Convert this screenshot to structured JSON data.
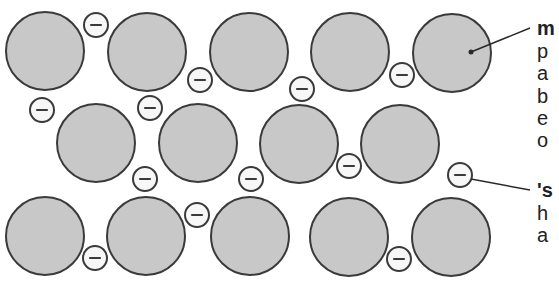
{
  "colors": {
    "ion_fill": "#c8c8c8",
    "ion_stroke": "#3a3a3a",
    "electron_fill": "#f7f7f7",
    "electron_stroke": "#3a3a3a",
    "line": "#2a2a2a",
    "text": "#222222"
  },
  "ions": [
    {
      "cx": 45,
      "cy": 51,
      "r": 39
    },
    {
      "cx": 147,
      "cy": 52,
      "r": 39
    },
    {
      "cx": 249,
      "cy": 52,
      "r": 39
    },
    {
      "cx": 350,
      "cy": 52,
      "r": 39
    },
    {
      "cx": 452,
      "cy": 53,
      "r": 39
    },
    {
      "cx": 96,
      "cy": 143,
      "r": 39
    },
    {
      "cx": 198,
      "cy": 143,
      "r": 39
    },
    {
      "cx": 299,
      "cy": 144,
      "r": 39
    },
    {
      "cx": 400,
      "cy": 144,
      "r": 39
    },
    {
      "cx": 45,
      "cy": 236,
      "r": 39
    },
    {
      "cx": 146,
      "cy": 236,
      "r": 39
    },
    {
      "cx": 250,
      "cy": 236,
      "r": 39
    },
    {
      "cx": 349,
      "cy": 237,
      "r": 39
    },
    {
      "cx": 451,
      "cy": 237,
      "r": 39
    }
  ],
  "electrons": [
    {
      "cx": 96,
      "cy": 25,
      "r": 12,
      "symbol": "−"
    },
    {
      "cx": 200,
      "cy": 80,
      "r": 12,
      "symbol": "−"
    },
    {
      "cx": 302,
      "cy": 89,
      "r": 12,
      "symbol": "−"
    },
    {
      "cx": 402,
      "cy": 75,
      "r": 12,
      "symbol": "−"
    },
    {
      "cx": 42,
      "cy": 110,
      "r": 12,
      "symbol": "−"
    },
    {
      "cx": 150,
      "cy": 108,
      "r": 12,
      "symbol": "−"
    },
    {
      "cx": 145,
      "cy": 179,
      "r": 12,
      "symbol": "−"
    },
    {
      "cx": 251,
      "cy": 179,
      "r": 12,
      "symbol": "−"
    },
    {
      "cx": 349,
      "cy": 166,
      "r": 12,
      "symbol": "−"
    },
    {
      "cx": 460,
      "cy": 175,
      "r": 12,
      "symbol": "−"
    },
    {
      "cx": 95,
      "cy": 258,
      "r": 12,
      "symbol": "−"
    },
    {
      "cx": 197,
      "cy": 215,
      "r": 12,
      "symbol": "−"
    },
    {
      "cx": 399,
      "cy": 259,
      "r": 12,
      "symbol": "−"
    }
  ],
  "pointers": [
    {
      "x1": 471,
      "y1": 52,
      "x2": 530,
      "y2": 28,
      "dot": true
    },
    {
      "x1": 471,
      "y1": 179,
      "x2": 530,
      "y2": 190,
      "dot": false
    }
  ],
  "labels": {
    "ion_label": {
      "lines": [
        {
          "text": "m",
          "bold": true,
          "top": 18
        },
        {
          "text": "p",
          "bold": false,
          "top": 41
        },
        {
          "text": "a",
          "bold": false,
          "top": 63
        },
        {
          "text": "b",
          "bold": false,
          "top": 86
        },
        {
          "text": "e",
          "bold": false,
          "top": 108
        },
        {
          "text": "o",
          "bold": false,
          "top": 130
        }
      ]
    },
    "electron_label": {
      "lines": [
        {
          "text": "'s",
          "bold": true,
          "top": 180
        },
        {
          "text": "h",
          "bold": false,
          "top": 203
        },
        {
          "text": "a",
          "bold": false,
          "top": 225
        }
      ]
    }
  }
}
